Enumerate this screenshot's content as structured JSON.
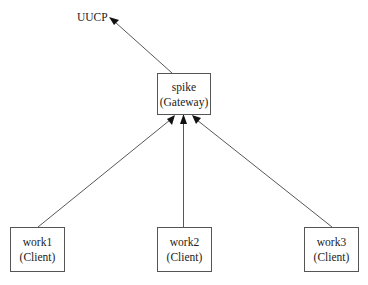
{
  "diagram": {
    "type": "network-topology",
    "external": {
      "id": "uucp",
      "label": "UUCP"
    },
    "nodes": [
      {
        "id": "spike",
        "name": "spike",
        "role": "(Gateway)"
      },
      {
        "id": "work1",
        "name": "work1",
        "role": "(Client)"
      },
      {
        "id": "work2",
        "name": "work2",
        "role": "(Client)"
      },
      {
        "id": "work3",
        "name": "work3",
        "role": "(Client)"
      }
    ],
    "edges": [
      {
        "from": "spike",
        "to": "uucp",
        "directed": true
      },
      {
        "from": "work1",
        "to": "spike",
        "directed": true
      },
      {
        "from": "work2",
        "to": "spike",
        "directed": true
      },
      {
        "from": "work3",
        "to": "spike",
        "directed": true
      }
    ]
  }
}
